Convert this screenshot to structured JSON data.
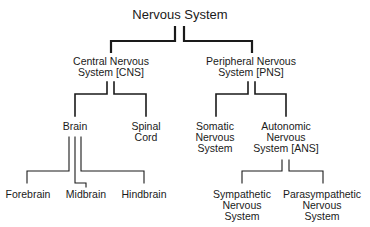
{
  "diagram": {
    "type": "tree",
    "title": "Nervous System",
    "root": {
      "label": "Nervous System",
      "children": [
        {
          "label": "Central Nervous System [CNS]",
          "lines": [
            "Central Nervous",
            "System [CNS]"
          ],
          "children": [
            {
              "label": "Brain",
              "lines": [
                "Brain"
              ],
              "children": [
                {
                  "label": "Forebrain",
                  "lines": [
                    "Forebrain"
                  ]
                },
                {
                  "label": "Midbrain",
                  "lines": [
                    "Midbrain"
                  ]
                },
                {
                  "label": "Hindbrain",
                  "lines": [
                    "Hindbrain"
                  ]
                }
              ]
            },
            {
              "label": "Spinal Cord",
              "lines": [
                "Spinal",
                "Cord"
              ]
            }
          ]
        },
        {
          "label": "Peripheral Nervous System [PNS]",
          "lines": [
            "Peripheral Nervous",
            "System [PNS]"
          ],
          "children": [
            {
              "label": "Somatic Nervous System",
              "lines": [
                "Somatic",
                "Nervous",
                "System"
              ]
            },
            {
              "label": "Autonomic Nervous System [ANS]",
              "lines": [
                "Autonomic",
                "Nervous",
                "System [ANS]"
              ],
              "children": [
                {
                  "label": "Sympathetic Nervous System",
                  "lines": [
                    "Sympathetic",
                    "Nervous",
                    "System"
                  ]
                },
                {
                  "label": "Parasympathetic Nervous System",
                  "lines": [
                    "Parasympathetic",
                    "Nervous",
                    "System"
                  ]
                }
              ]
            }
          ]
        }
      ]
    }
  },
  "colors": {
    "line": "#1a1a1a",
    "text": "#1a1a1a",
    "background": "#ffffff"
  }
}
